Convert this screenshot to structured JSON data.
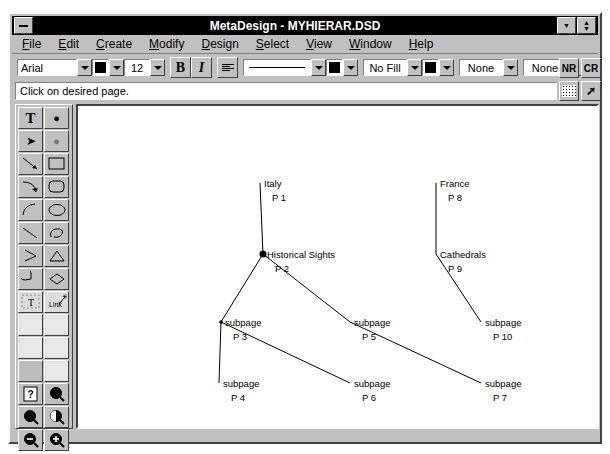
{
  "window": {
    "title": "MetaDesign - MYHIERAR.DSD",
    "minimize_icon": "minimize-icon",
    "restore_icon": "restore-icon",
    "dropdown_icon": "chevron-down-icon"
  },
  "menu": {
    "items": [
      {
        "label": "File",
        "accel": "F"
      },
      {
        "label": "Edit",
        "accel": "E"
      },
      {
        "label": "Create",
        "accel": "C"
      },
      {
        "label": "Modify",
        "accel": "M"
      },
      {
        "label": "Design",
        "accel": "D"
      },
      {
        "label": "Select",
        "accel": "S"
      },
      {
        "label": "View",
        "accel": "V"
      },
      {
        "label": "Window",
        "accel": "W"
      },
      {
        "label": "Help",
        "accel": "H"
      }
    ]
  },
  "toolbar": {
    "font_name": "Arial",
    "font_size": "12",
    "bold_label": "B",
    "italic_label": "I",
    "fill_label": "No Fill",
    "arrow_start": "None",
    "arrow_end": "None",
    "nr_label": "NR",
    "cr_label": "CR",
    "text_color": "#000000",
    "line_color": "#000000",
    "fill_color": "#000000",
    "align_icon": "align-icon",
    "grid-icon": "grid-icon",
    "pointer_icon": "pointer-icon"
  },
  "statusbar": {
    "message": "Click on desired page."
  },
  "palette": {
    "tools": [
      {
        "name": "text-tool",
        "glyph": "T"
      },
      {
        "name": "filled-circle-tool",
        "glyph": "●"
      },
      {
        "name": "pointer-tool",
        "glyph": "➤"
      },
      {
        "name": "hollow-circle-tool",
        "glyph": "○"
      },
      {
        "name": "line-tool",
        "glyph": "╲"
      },
      {
        "name": "rectangle-tool",
        "glyph": "□"
      },
      {
        "name": "arc-arrow-tool",
        "glyph": "⤵"
      },
      {
        "name": "rounded-rect-tool",
        "glyph": "▢"
      },
      {
        "name": "curve-tool",
        "glyph": "⌒"
      },
      {
        "name": "ellipse-tool",
        "glyph": "◯"
      },
      {
        "name": "diagonal-line-tool",
        "glyph": "╱"
      },
      {
        "name": "freeform-tool",
        "glyph": "∿"
      },
      {
        "name": "angle-tool",
        "glyph": ">"
      },
      {
        "name": "triangle-tool",
        "glyph": "△"
      },
      {
        "name": "pie-tool",
        "glyph": "◔"
      },
      {
        "name": "diamond-tool",
        "glyph": "◇"
      },
      {
        "name": "text-frame-tool",
        "glyph": "T"
      },
      {
        "name": "link-tool",
        "glyph": "Link"
      },
      {
        "name": "texture-tool-a",
        "glyph": ""
      },
      {
        "name": "texture-tool-b",
        "glyph": ""
      },
      {
        "name": "texture-tool-c",
        "glyph": ""
      },
      {
        "name": "texture-tool-d",
        "glyph": ""
      },
      {
        "name": "figure-tool",
        "glyph": ""
      },
      {
        "name": "sketch-tool",
        "glyph": ""
      },
      {
        "name": "help-tool",
        "glyph": "?"
      },
      {
        "name": "magnifier-tool",
        "glyph": "●"
      },
      {
        "name": "magnifier-dark-tool",
        "glyph": "●"
      },
      {
        "name": "magnifier-half-tool",
        "glyph": "◑"
      },
      {
        "name": "zoom-out-tool",
        "glyph": "−"
      },
      {
        "name": "zoom-in-tool",
        "glyph": "+"
      }
    ]
  },
  "diagram": {
    "nodes": [
      {
        "id": "n1",
        "title": "Italy",
        "page": "P 1",
        "x": 182,
        "y": 77,
        "marker": false
      },
      {
        "id": "n2",
        "title": "Historical Sights",
        "page": "P 2",
        "x": 185,
        "y": 148,
        "marker": true
      },
      {
        "id": "n3",
        "title": "subpage",
        "page": "P 3",
        "x": 143,
        "y": 216,
        "marker": true
      },
      {
        "id": "n4",
        "title": "subpage",
        "page": "P 4",
        "x": 141,
        "y": 277,
        "marker": false
      },
      {
        "id": "n5",
        "title": "subpage",
        "page": "P 5",
        "x": 272,
        "y": 216,
        "marker": false
      },
      {
        "id": "n6",
        "title": "subpage",
        "page": "P 6",
        "x": 272,
        "y": 277,
        "marker": false
      },
      {
        "id": "n7",
        "title": "subpage",
        "page": "P 7",
        "x": 403,
        "y": 277,
        "marker": false
      },
      {
        "id": "n8",
        "title": "France",
        "page": "P 8",
        "x": 358,
        "y": 77,
        "marker": false
      },
      {
        "id": "n9",
        "title": "Cathedrals",
        "page": "P 9",
        "x": 358,
        "y": 148,
        "marker": false
      },
      {
        "id": "n10",
        "title": "subpage",
        "page": "P 10",
        "x": 403,
        "y": 216,
        "marker": false
      }
    ],
    "edges": [
      {
        "from": "n1",
        "to": "n2"
      },
      {
        "from": "n2",
        "to": "n3"
      },
      {
        "from": "n2",
        "to": "n5"
      },
      {
        "from": "n3",
        "to": "n4"
      },
      {
        "from": "n3",
        "to": "n6"
      },
      {
        "from": "n5",
        "to": "n7"
      },
      {
        "from": "n8",
        "to": "n9"
      },
      {
        "from": "n9",
        "to": "n10"
      }
    ]
  }
}
